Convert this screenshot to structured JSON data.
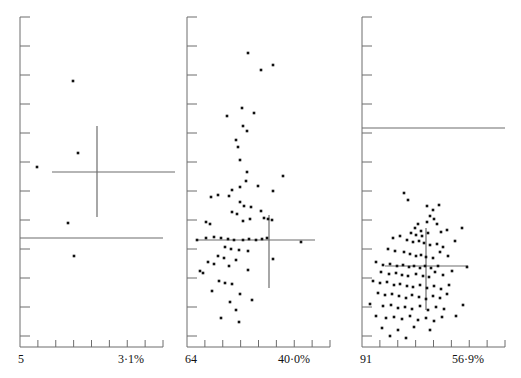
{
  "figure": {
    "type": "multi-panel-scatter",
    "panel_count": 3,
    "width": 521,
    "height": 378,
    "background": "#ffffff",
    "ink_color": "#111111",
    "line_color": "#6d6d6d"
  },
  "chart_data": [
    {
      "type": "scatter",
      "name": "panel-1",
      "title": "",
      "xlabel": "",
      "ylabel": "",
      "grid": false,
      "legend": null,
      "x_axis": {
        "left_label": "5",
        "right_label": "3·1%",
        "tick_count": 8,
        "axis_y_px": 347,
        "x_start_px": 20,
        "x_end_px": 163
      },
      "y_axis": {
        "tick_count": 12,
        "axis_x_px": 20,
        "y_start_px": 17,
        "y_end_px": 336
      },
      "points_px": [
        [
          73,
          81
        ],
        [
          37,
          167
        ],
        [
          78,
          153
        ],
        [
          68,
          223
        ],
        [
          74,
          256
        ]
      ],
      "cross": {
        "cx": 97,
        "cy": 172,
        "x_left": 52,
        "x_right": 178,
        "y_top": 126,
        "y_bottom": 217
      },
      "reference_line": {
        "y": 238,
        "x_left": 20,
        "x_right": 163
      }
    },
    {
      "type": "scatter",
      "name": "panel-2",
      "title": "",
      "xlabel": "",
      "ylabel": "",
      "grid": false,
      "legend": null,
      "x_axis": {
        "left_label": "64",
        "right_label": "40·0%",
        "tick_count": 8,
        "axis_y_px": 347,
        "x_start_px": 187,
        "x_end_px": 330
      },
      "y_axis": {
        "tick_count": 12,
        "axis_x_px": 187,
        "y_start_px": 17,
        "y_end_px": 336
      },
      "points_px": [
        [
          248,
          53
        ],
        [
          273,
          65
        ],
        [
          261,
          70
        ],
        [
          242,
          108
        ],
        [
          254,
          113
        ],
        [
          227,
          116
        ],
        [
          243,
          126
        ],
        [
          247,
          131
        ],
        [
          236,
          140
        ],
        [
          238,
          147
        ],
        [
          240,
          160
        ],
        [
          247,
          172
        ],
        [
          246,
          181
        ],
        [
          240,
          187
        ],
        [
          258,
          186
        ],
        [
          283,
          176
        ],
        [
          232,
          190
        ],
        [
          229,
          196
        ],
        [
          211,
          197
        ],
        [
          218,
          195
        ],
        [
          273,
          191
        ],
        [
          240,
          202
        ],
        [
          244,
          206
        ],
        [
          251,
          207
        ],
        [
          232,
          212
        ],
        [
          237,
          214
        ],
        [
          261,
          211
        ],
        [
          206,
          222
        ],
        [
          210,
          224
        ],
        [
          250,
          219
        ],
        [
          243,
          221
        ],
        [
          264,
          218
        ],
        [
          268,
          219
        ],
        [
          272,
          220
        ],
        [
          197,
          240
        ],
        [
          206,
          238
        ],
        [
          214,
          237
        ],
        [
          221,
          238
        ],
        [
          228,
          239
        ],
        [
          234,
          240
        ],
        [
          243,
          240
        ],
        [
          249,
          239
        ],
        [
          256,
          240
        ],
        [
          262,
          239
        ],
        [
          267,
          238
        ],
        [
          301,
          242
        ],
        [
          225,
          247
        ],
        [
          231,
          249
        ],
        [
          239,
          250
        ],
        [
          248,
          251
        ],
        [
          218,
          256
        ],
        [
          224,
          258
        ],
        [
          236,
          260
        ],
        [
          273,
          259
        ],
        [
          208,
          262
        ],
        [
          214,
          264
        ],
        [
          229,
          266
        ],
        [
          200,
          271
        ],
        [
          203,
          273
        ],
        [
          248,
          270
        ],
        [
          219,
          281
        ],
        [
          225,
          283
        ],
        [
          232,
          284
        ],
        [
          212,
          291
        ],
        [
          240,
          294
        ],
        [
          230,
          302
        ],
        [
          236,
          310
        ],
        [
          221,
          318
        ],
        [
          239,
          322
        ],
        [
          252,
          300
        ]
      ],
      "cross": {
        "cx": 269,
        "cy": 240,
        "x_left": 196,
        "x_right": 315,
        "y_top": 215,
        "y_bottom": 288
      },
      "reference_line": null
    },
    {
      "type": "scatter",
      "name": "panel-3",
      "title": "",
      "xlabel": "",
      "ylabel": "",
      "grid": false,
      "legend": null,
      "x_axis": {
        "left_label": "91",
        "right_label": "56·9%",
        "tick_count": 8,
        "axis_y_px": 347,
        "x_start_px": 362,
        "x_end_px": 505
      },
      "y_axis": {
        "tick_count": 12,
        "axis_x_px": 362,
        "y_start_px": 17,
        "y_end_px": 336
      },
      "points_px": [
        [
          404,
          193
        ],
        [
          408,
          200
        ],
        [
          427,
          206
        ],
        [
          433,
          210
        ],
        [
          439,
          205
        ],
        [
          430,
          216
        ],
        [
          434,
          219
        ],
        [
          427,
          222
        ],
        [
          437,
          224
        ],
        [
          418,
          224
        ],
        [
          415,
          228
        ],
        [
          421,
          231
        ],
        [
          411,
          233
        ],
        [
          416,
          235
        ],
        [
          422,
          236
        ],
        [
          428,
          233
        ],
        [
          441,
          232
        ],
        [
          447,
          230
        ],
        [
          462,
          228
        ],
        [
          393,
          238
        ],
        [
          400,
          236
        ],
        [
          407,
          240
        ],
        [
          413,
          242
        ],
        [
          419,
          241
        ],
        [
          424,
          243
        ],
        [
          430,
          245
        ],
        [
          437,
          244
        ],
        [
          443,
          247
        ],
        [
          455,
          241
        ],
        [
          388,
          249
        ],
        [
          395,
          251
        ],
        [
          404,
          252
        ],
        [
          410,
          254
        ],
        [
          416,
          256
        ],
        [
          421,
          255
        ],
        [
          426,
          257
        ],
        [
          433,
          258
        ],
        [
          440,
          252
        ],
        [
          448,
          256
        ],
        [
          376,
          262
        ],
        [
          383,
          265
        ],
        [
          390,
          264
        ],
        [
          397,
          266
        ],
        [
          403,
          265
        ],
        [
          409,
          267
        ],
        [
          414,
          266
        ],
        [
          420,
          268
        ],
        [
          425,
          266
        ],
        [
          431,
          268
        ],
        [
          438,
          266
        ],
        [
          381,
          272
        ],
        [
          389,
          274
        ],
        [
          396,
          273
        ],
        [
          402,
          275
        ],
        [
          408,
          276
        ],
        [
          416,
          274
        ],
        [
          423,
          276
        ],
        [
          429,
          277
        ],
        [
          435,
          272
        ],
        [
          443,
          275
        ],
        [
          452,
          271
        ],
        [
          467,
          267
        ],
        [
          373,
          281
        ],
        [
          380,
          283
        ],
        [
          387,
          282
        ],
        [
          394,
          285
        ],
        [
          400,
          284
        ],
        [
          407,
          286
        ],
        [
          413,
          287
        ],
        [
          420,
          285
        ],
        [
          427,
          288
        ],
        [
          434,
          286
        ],
        [
          441,
          289
        ],
        [
          449,
          285
        ],
        [
          378,
          293
        ],
        [
          385,
          295
        ],
        [
          392,
          294
        ],
        [
          399,
          296
        ],
        [
          406,
          298
        ],
        [
          412,
          295
        ],
        [
          419,
          297
        ],
        [
          426,
          299
        ],
        [
          433,
          296
        ],
        [
          440,
          298
        ],
        [
          447,
          294
        ],
        [
          370,
          304
        ],
        [
          383,
          306
        ],
        [
          391,
          305
        ],
        [
          398,
          308
        ],
        [
          405,
          307
        ],
        [
          412,
          309
        ],
        [
          420,
          306
        ],
        [
          428,
          310
        ],
        [
          436,
          307
        ],
        [
          444,
          309
        ],
        [
          376,
          316
        ],
        [
          386,
          318
        ],
        [
          394,
          317
        ],
        [
          402,
          319
        ],
        [
          410,
          316
        ],
        [
          418,
          320
        ],
        [
          426,
          318
        ],
        [
          434,
          321
        ],
        [
          442,
          317
        ],
        [
          382,
          328
        ],
        [
          398,
          330
        ],
        [
          414,
          327
        ],
        [
          430,
          330
        ],
        [
          390,
          336
        ],
        [
          406,
          338
        ],
        [
          456,
          316
        ],
        [
          463,
          305
        ]
      ],
      "cross": {
        "cx": 426,
        "cy": 266,
        "x_left": 385,
        "x_right": 468,
        "y_top": 228,
        "y_bottom": 310
      },
      "reference_line": {
        "y": 128,
        "x_left": 362,
        "x_right": 505
      }
    }
  ]
}
